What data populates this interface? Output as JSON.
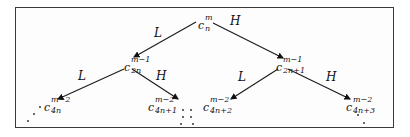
{
  "diagram": {
    "type": "binary-tree",
    "nodes": [
      {
        "id": "root",
        "base": "c",
        "sup": "m",
        "sub": "n"
      },
      {
        "id": "l",
        "base": "c",
        "sup": "m−1",
        "sub": "2n"
      },
      {
        "id": "h",
        "base": "c",
        "sup": "m−1",
        "sub": "2n+1"
      },
      {
        "id": "ll",
        "base": "c",
        "sup": "m−2",
        "sub": "4n"
      },
      {
        "id": "lh",
        "base": "c",
        "sup": "m−2",
        "sub": "4n+1"
      },
      {
        "id": "hl",
        "base": "c",
        "sup": "m−2",
        "sub": "4n+2"
      },
      {
        "id": "hh",
        "base": "c",
        "sup": "m−2",
        "sub": "4n+3"
      }
    ],
    "edges": [
      {
        "from": "root",
        "to": "l",
        "label": "L"
      },
      {
        "from": "root",
        "to": "h",
        "label": "H"
      },
      {
        "from": "l",
        "to": "ll",
        "label": "L"
      },
      {
        "from": "l",
        "to": "lh",
        "label": "H"
      },
      {
        "from": "h",
        "to": "hl",
        "label": "L"
      },
      {
        "from": "h",
        "to": "hh",
        "label": "H"
      }
    ],
    "continuation": "⋰ ⋱"
  }
}
